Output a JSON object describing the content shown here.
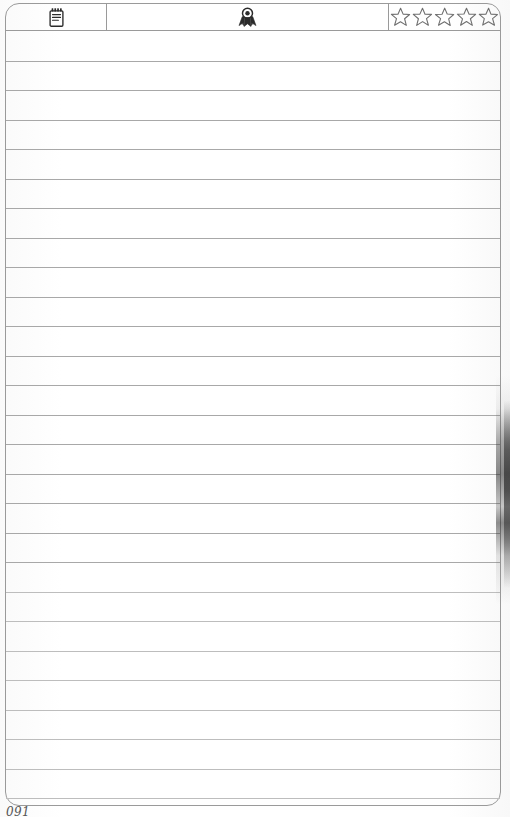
{
  "document": {
    "kind": "scanned-journal-page",
    "page_number": "091",
    "paper_color": "#fefefe",
    "ink_color": "#9a9a9a",
    "rule_color": "#a8a8a8"
  },
  "header": {
    "cells": [
      {
        "id": "notes",
        "icon": "notepad-icon",
        "label": ""
      },
      {
        "id": "award",
        "icon": "award-rosette-icon",
        "label": ""
      },
      {
        "id": "rating",
        "icon": "star-outline-icon",
        "label": ""
      }
    ]
  },
  "rating": {
    "max": 5,
    "filled": 0,
    "stars": [
      "empty",
      "empty",
      "empty",
      "empty",
      "empty"
    ]
  },
  "body": {
    "rule_line_count": 26,
    "rule_line_spacing_px": 29.5,
    "content": ""
  },
  "artifacts": {
    "right_edge_shadow": true
  }
}
